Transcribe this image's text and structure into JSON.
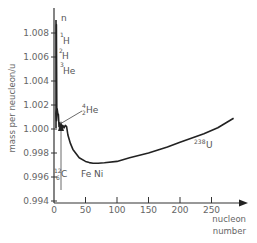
{
  "chart_data": {
    "type": "line",
    "title": "",
    "xlabel": "nucleon number",
    "ylabel": "mass per nucleon / u",
    "xlim": [
      0,
      290
    ],
    "ylim": [
      0.994,
      1.0093
    ],
    "xticks": [
      0,
      50,
      100,
      150,
      200,
      250
    ],
    "yticks": [
      0.994,
      0.996,
      0.998,
      1.0,
      1.002,
      1.004,
      1.006,
      1.008
    ],
    "ytick_labels": [
      "0.994",
      "0.996",
      "0.998",
      "1.000",
      "1.002",
      "1.004",
      "1.006",
      "1.008"
    ],
    "grid": false,
    "legend": null,
    "series": [
      {
        "name": "mass per nucleon",
        "x": [
          1,
          1.5,
          2,
          3,
          4,
          5,
          6,
          7,
          8,
          9,
          10,
          12,
          14,
          16,
          18,
          20,
          22,
          26,
          30,
          40,
          50,
          56,
          62,
          70,
          80,
          100,
          120,
          150,
          180,
          200,
          238,
          260,
          285
        ],
        "values": [
          1.0087,
          1.0087,
          1.0017,
          1.0013,
          1.0007,
          1.0017,
          1.0013,
          1.0012,
          1.0002,
          1.0005,
          1.0003,
          1.0,
          1.0003,
          1.0001,
          1.0003,
          1.0002,
          0.9995,
          0.9988,
          0.9983,
          0.9976,
          0.9973,
          0.9972,
          0.99715,
          0.99715,
          0.99718,
          0.9973,
          0.9976,
          0.998,
          0.9985,
          0.9989,
          0.9996,
          1.0001,
          1.0009
        ]
      }
    ],
    "annotations": [
      {
        "text": "n",
        "x": 1,
        "y": 1.00866
      },
      {
        "text": "1H",
        "mass_number": "1",
        "x": 1,
        "y": 1.00783
      },
      {
        "text": "2H",
        "mass_number": "2",
        "x": 2,
        "y": 1.00705
      },
      {
        "text": "3He",
        "mass_number": "3",
        "x": 3,
        "y": 1.00538
      },
      {
        "text": "4 2He",
        "mass_number": "4",
        "atomic_number": "2",
        "x": 4,
        "y": 1.0007
      },
      {
        "text": "12 6C",
        "mass_number": "12",
        "atomic_number": "6",
        "x": 12,
        "y": 1.0
      },
      {
        "text": "Fe Ni",
        "x": 58,
        "y": 0.9972
      },
      {
        "text": "238U",
        "mass_number": "238",
        "x": 238,
        "y": 0.9996
      }
    ]
  },
  "labels": {
    "y_axis_title": "mass per neucleon/u",
    "x_axis_title_line1": "nucleon",
    "x_axis_title_line2": "number",
    "n": "n",
    "h1_mass": "1",
    "h1_symbol": "H",
    "h2_mass": "2",
    "h2_symbol": "H",
    "he3_mass": "3",
    "he3_symbol": "He",
    "he4_mass": "4",
    "he4_atomic": "2",
    "he4_symbol": "He",
    "c12_mass": "12",
    "c12_atomic": "6",
    "c12_symbol": "C",
    "feni": "Fe Ni",
    "u238_mass": "238",
    "u238_symbol": "U"
  }
}
